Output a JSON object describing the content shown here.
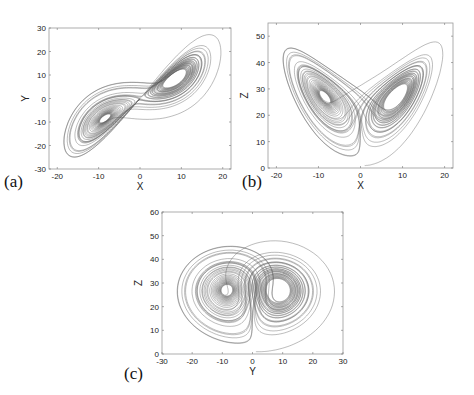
{
  "figure": {
    "line_color": "#5a5a5a",
    "frame_color": "#9a9a9a",
    "background": "#ffffff"
  },
  "chart_data": [
    {
      "id": "a",
      "type": "line",
      "panel_label": "(a)",
      "title": "",
      "xlabel": "X",
      "ylabel": "Y",
      "projection": [
        "x",
        "y"
      ],
      "xlim": [
        -22,
        22
      ],
      "ylim": [
        -30,
        30
      ],
      "xticks": [
        -20,
        -10,
        0,
        10,
        20
      ],
      "yticks": [
        -30,
        -20,
        -10,
        0,
        10,
        20,
        30
      ],
      "grid": false,
      "series": [
        {
          "name": "Lorenz attractor (x-y projection)",
          "description": "two lobes centered near (-8.5,-8.5) and (8.5,8.5)"
        }
      ],
      "frame": {
        "left": 49,
        "top": 28,
        "right": 231,
        "bottom": 169
      },
      "label_pos": {
        "left": 4,
        "top": 172
      }
    },
    {
      "id": "b",
      "type": "line",
      "panel_label": "(b)",
      "title": "",
      "xlabel": "X",
      "ylabel": "Z",
      "projection": [
        "x",
        "z"
      ],
      "xlim": [
        -22,
        22
      ],
      "ylim": [
        0,
        55
      ],
      "xticks": [
        -20,
        -10,
        0,
        10,
        20
      ],
      "yticks": [
        0,
        10,
        20,
        30,
        40,
        50
      ],
      "grid": false,
      "series": [
        {
          "name": "Lorenz attractor (x-z projection)",
          "description": "butterfly with lobes centered near (-8.5,27) and (8.5,27)"
        }
      ],
      "frame": {
        "left": 268,
        "top": 23,
        "right": 453,
        "bottom": 168
      },
      "label_pos": {
        "left": 242,
        "top": 172
      }
    },
    {
      "id": "c",
      "type": "line",
      "panel_label": "(c)",
      "title": "",
      "xlabel": "Y",
      "ylabel": "Z",
      "projection": [
        "y",
        "z"
      ],
      "xlim": [
        -30,
        30
      ],
      "ylim": [
        0,
        60
      ],
      "xticks": [
        -30,
        -20,
        -10,
        0,
        10,
        20,
        30
      ],
      "yticks": [
        0,
        10,
        20,
        30,
        40,
        50,
        60
      ],
      "grid": false,
      "series": [
        {
          "name": "Lorenz attractor (y-z projection)",
          "description": "two lobes centered near (-8.5,27) and (8.5,27)"
        }
      ],
      "frame": {
        "left": 162,
        "top": 212,
        "right": 343,
        "bottom": 354
      },
      "label_pos": {
        "left": 124,
        "top": 364
      }
    }
  ],
  "simulation": {
    "sigma": 10,
    "rho": 28,
    "beta": 2.6667,
    "initial": [
      1,
      1,
      1
    ],
    "dt": 0.005,
    "steps": 9000
  }
}
